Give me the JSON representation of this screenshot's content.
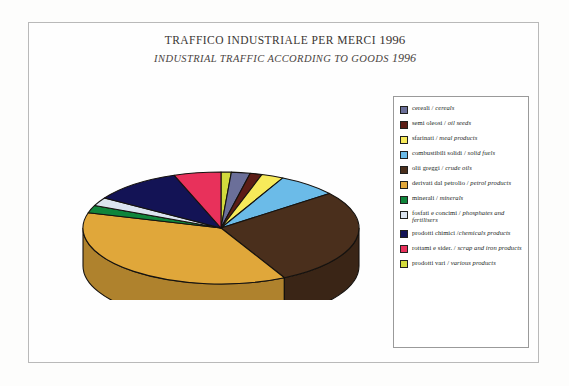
{
  "page": {
    "background_color": "#fdfdfc",
    "frame_color": "#b9b9b9"
  },
  "title": {
    "italian": "TRAFFICO INDUSTRIALE PER MERCI",
    "italian_year": "1996",
    "english": "INDUSTRIAL TRAFFIC ACCORDING TO GOODS",
    "english_year": "1996"
  },
  "legend": {
    "items": [
      {
        "color": "#6b6f99",
        "it": "cereali",
        "sep": " / ",
        "en": "cereals"
      },
      {
        "color": "#5c1d16",
        "it": "semi oleosi",
        "sep": " / ",
        "en": "oil seeds"
      },
      {
        "color": "#f7ea5a",
        "it": "sfarinati",
        "sep": " / ",
        "en": "meal products"
      },
      {
        "color": "#6bbbe8",
        "it": "combustibili solidi",
        "sep": " / ",
        "en": "solid fuels"
      },
      {
        "color": "#4a2f1c",
        "it": "olii greggi",
        "sep": " / ",
        "en": "crude oils"
      },
      {
        "color": "#e0a73a",
        "it": "derivati dal petrolio",
        "sep": " / ",
        "en": "petrol products"
      },
      {
        "color": "#10853b",
        "it": "minerali",
        "sep": " / ",
        "en": "minerals"
      },
      {
        "color": "#dbe4ef",
        "it": "fosfati e concimi",
        "sep": " / ",
        "en": "phosphates and fertilisers"
      },
      {
        "color": "#131355",
        "it": "prodotti chimici",
        "sep": " /",
        "en": "chemicals products"
      },
      {
        "color": "#e8315b",
        "it": "rottami e sider.",
        "sep": " / ",
        "en": "scrap and iron products"
      },
      {
        "color": "#d2da3c",
        "it": "prodotti vari",
        "sep": " / ",
        "en": "various products"
      }
    ]
  },
  "chart_data": {
    "type": "pie",
    "three_d": true,
    "legend_position": "right",
    "labels": [
      "prodotti vari / various products",
      "cereali / cereals",
      "semi oleosi / oil seeds",
      "sfarinati / meal products",
      "combustibili solidi / solid fuels",
      "olii greggi / crude oils",
      "derivati dal petrolio / petrol products",
      "minerali / minerals",
      "fosfati e concimi / phosphates and fertilisers",
      "prodotti chimici / chemicals products",
      "rottami e sider. / scrap and iron products"
    ],
    "values": [
      1.2,
      2.2,
      1.4,
      2.6,
      7.0,
      28.0,
      37.0,
      2.2,
      2.4,
      10.5,
      5.5
    ],
    "colors": [
      "#d2da3c",
      "#6b6f99",
      "#5c1d16",
      "#f7ea5a",
      "#6bbbe8",
      "#4a2f1c",
      "#e0a73a",
      "#10853b",
      "#dbe4ef",
      "#131355",
      "#e8315b"
    ],
    "unit": "percent"
  }
}
